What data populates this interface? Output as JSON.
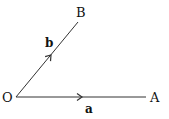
{
  "diagram": {
    "type": "vector-diagram",
    "points": {
      "origin": {
        "label": "O",
        "x": 16,
        "y": 97
      },
      "A": {
        "label": "A",
        "x": 146,
        "y": 97
      },
      "B": {
        "label": "B",
        "x": 78,
        "y": 22
      }
    },
    "vectors": [
      {
        "name": "a",
        "label": "a",
        "from": "O",
        "to": "A"
      },
      {
        "name": "b",
        "label": "b",
        "from": "O",
        "to": "B"
      }
    ],
    "colors": {
      "line": "#333333",
      "text": "#111111",
      "background": "#ffffff"
    }
  }
}
